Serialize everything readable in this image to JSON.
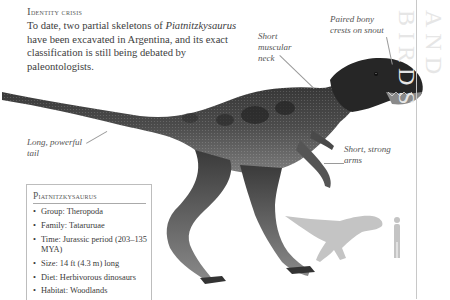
{
  "intro": {
    "heading": "Identity crisis",
    "body_prefix": "To date, two partial skeletons of ",
    "body_species": "Piatnitzkysaurus",
    "body_suffix": " have been excavated in Argentina, and its exact classification is still being debated by paleontologists."
  },
  "callouts": {
    "neck": "Short muscular neck",
    "crests": "Paired bony crests on snout",
    "tail": "Long, powerful tail",
    "arms": "Short, strong arms"
  },
  "side_title": "and birds",
  "fact_box": {
    "title": "Piatnitzkysaurus",
    "items": [
      "Group: Theropoda",
      "Family: Tataruruae",
      "Time: Jurassic period (203–135 MYA)",
      "Size: 14 ft (4.3 m) long",
      "Diet: Herbivorous dinosaurs",
      "Habitat: Woodlands"
    ]
  },
  "illustration": {
    "main_subject": "Piatnitzkysaurus illustration",
    "scale_silhouette": "dinosaur-vs-human scale silhouette"
  },
  "colors": {
    "dino_dark": "#2a2a2a",
    "dino_mid": "#5a5a5a",
    "dino_light": "#9a9a9a",
    "silhouette": "#c4c4c4",
    "rule": "#c8c8c8",
    "side_title": "#e6e6e6"
  }
}
